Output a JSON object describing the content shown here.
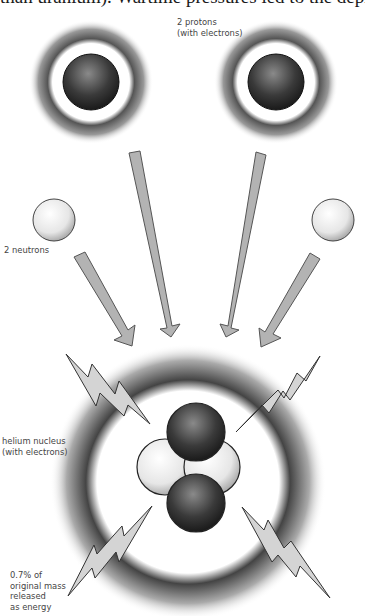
{
  "top_text": "than uranium). Wartime pressures led to the deployment of",
  "labels": {
    "protons": "2 protons\n(with electrons)",
    "neutrons": "2 neutrons",
    "helium": "helium nucleus\n(with electrons)",
    "energy": "0.7% of\noriginal mass\nreleased\nas energy"
  },
  "colors": {
    "arrow_fill": "#b3b3b3",
    "arrow_stroke": "#555555",
    "proton": "#3a3a3a",
    "neutron": "#e8e8e8",
    "bolt_fill": "#d4d4d4"
  }
}
